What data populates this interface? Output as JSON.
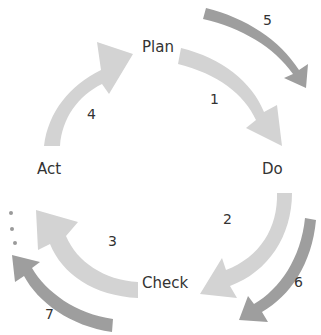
{
  "diagram": {
    "type": "cycle",
    "stages": [
      {
        "label": "Plan"
      },
      {
        "label": "Do"
      },
      {
        "label": "Check"
      },
      {
        "label": "Act"
      }
    ],
    "arrows": [
      {
        "number": "1",
        "from": "Plan",
        "to": "Do",
        "style": "inner"
      },
      {
        "number": "2",
        "from": "Do",
        "to": "Check",
        "style": "inner"
      },
      {
        "number": "3",
        "from": "Check",
        "to": "Act",
        "style": "inner"
      },
      {
        "number": "4",
        "from": "Act",
        "to": "Plan",
        "style": "inner"
      },
      {
        "number": "5",
        "style": "outer"
      },
      {
        "number": "6",
        "style": "outer"
      },
      {
        "number": "7",
        "style": "outer"
      }
    ],
    "continuation": "..."
  },
  "colors": {
    "inner_arrow": "#d3d3d3",
    "outer_arrow": "#9e9e9e",
    "text": "#333333"
  }
}
